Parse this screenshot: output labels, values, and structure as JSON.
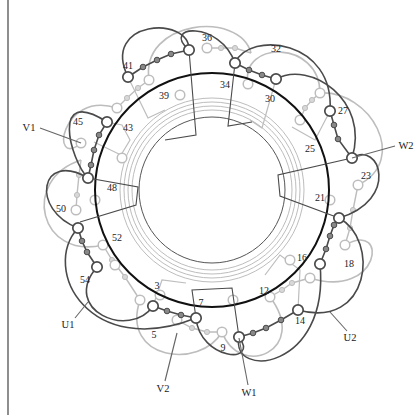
{
  "diagram": {
    "type": "stator winding diagram (54 slots, 3-phase)",
    "colors": {
      "dark": "#4a4a4a",
      "light": "#bdbdbd",
      "ring": "#111111",
      "text": "#222222",
      "background": "#ffffff"
    },
    "center": [
      212,
      190
    ],
    "main_ring_radius": 117,
    "inner_ring_radius": 73,
    "guide_ring_radii": [
      80,
      84,
      88,
      92
    ],
    "slot_labels": [
      {
        "text": "36",
        "x": 207,
        "y": 41
      },
      {
        "text": "32",
        "x": 276,
        "y": 52
      },
      {
        "text": "41",
        "x": 128,
        "y": 69
      },
      {
        "text": "34",
        "x": 225,
        "y": 88
      },
      {
        "text": "39",
        "x": 164,
        "y": 99
      },
      {
        "text": "30",
        "x": 270,
        "y": 102
      },
      {
        "text": "27",
        "x": 343,
        "y": 114
      },
      {
        "text": "45",
        "x": 78,
        "y": 125
      },
      {
        "text": "43",
        "x": 128,
        "y": 131
      },
      {
        "text": "25",
        "x": 310,
        "y": 152
      },
      {
        "text": "23",
        "x": 366,
        "y": 179
      },
      {
        "text": "48",
        "x": 112,
        "y": 191
      },
      {
        "text": "21",
        "x": 320,
        "y": 201
      },
      {
        "text": "50",
        "x": 61,
        "y": 212
      },
      {
        "text": "52",
        "x": 117,
        "y": 241
      },
      {
        "text": "16",
        "x": 302,
        "y": 261
      },
      {
        "text": "18",
        "x": 349,
        "y": 267
      },
      {
        "text": "54",
        "x": 85,
        "y": 283
      },
      {
        "text": "3",
        "x": 157,
        "y": 289
      },
      {
        "text": "12",
        "x": 264,
        "y": 294
      },
      {
        "text": "7",
        "x": 201,
        "y": 306
      },
      {
        "text": "14",
        "x": 300,
        "y": 324
      },
      {
        "text": "5",
        "x": 154,
        "y": 338
      },
      {
        "text": "9",
        "x": 223,
        "y": 351
      }
    ],
    "terminals": [
      {
        "text": "V1",
        "x": 29,
        "y": 131,
        "lead": [
          40,
          128,
          81,
          143
        ]
      },
      {
        "text": "W2",
        "x": 406,
        "y": 149,
        "lead": [
          395,
          146,
          352,
          158
        ]
      },
      {
        "text": "U1",
        "x": 68,
        "y": 328,
        "lead": [
          75,
          318,
          88,
          302
        ]
      },
      {
        "text": "U2",
        "x": 350,
        "y": 341,
        "lead": [
          347,
          331,
          330,
          312
        ]
      },
      {
        "text": "V2",
        "x": 163,
        "y": 392,
        "lead": [
          165,
          381,
          177,
          333
        ]
      },
      {
        "text": "W1",
        "x": 249,
        "y": 396,
        "lead": [
          248,
          385,
          239,
          338
        ]
      }
    ],
    "dark_nodes": [
      [
        189,
        50
      ],
      [
        128,
        77
      ],
      [
        107,
        122
      ],
      [
        88,
        178
      ],
      [
        78,
        228
      ],
      [
        97,
        267
      ],
      [
        153,
        306
      ],
      [
        196,
        318
      ],
      [
        239,
        337
      ],
      [
        298,
        310
      ],
      [
        320,
        264
      ],
      [
        339,
        218
      ],
      [
        352,
        158
      ],
      [
        330,
        111
      ],
      [
        276,
        79
      ],
      [
        235,
        63
      ]
    ],
    "dark_chains": [
      [
        [
          128,
          77
        ],
        [
          143,
          67
        ],
        [
          157,
          60
        ],
        [
          171,
          54
        ],
        [
          189,
          50
        ]
      ],
      [
        [
          88,
          178
        ],
        [
          91,
          165
        ],
        [
          94,
          150
        ],
        [
          99,
          135
        ],
        [
          107,
          122
        ]
      ],
      [
        [
          78,
          228
        ],
        [
          82,
          241
        ],
        [
          87,
          252
        ],
        [
          97,
          267
        ]
      ],
      [
        [
          153,
          306
        ],
        [
          167,
          311
        ],
        [
          181,
          315
        ],
        [
          196,
          318
        ]
      ],
      [
        [
          239,
          337
        ],
        [
          253,
          333
        ],
        [
          266,
          328
        ],
        [
          281,
          320
        ],
        [
          298,
          310
        ]
      ],
      [
        [
          320,
          264
        ],
        [
          326,
          249
        ],
        [
          330,
          236
        ],
        [
          334,
          225
        ],
        [
          339,
          218
        ]
      ],
      [
        [
          330,
          111
        ],
        [
          334,
          125
        ],
        [
          338,
          139
        ],
        [
          352,
          158
        ]
      ],
      [
        [
          235,
          63
        ],
        [
          249,
          70
        ],
        [
          262,
          75
        ],
        [
          276,
          79
        ]
      ]
    ],
    "dark_arcs": [
      "M 128 77 C 100 20, 190 15, 189 50",
      "M 107 122 C 50 85, 70 160, 88 178",
      "M 88 178 C 40 150, 30 210, 78 228",
      "M 97 267 C 60 310, 130 340, 153 306",
      "M 78 228 C 40 270, 90 360, 196 318",
      "M 196 318 C 200 360, 260 365, 239 337",
      "M 239 337 C 230 380, 330 370, 320 264",
      "M 298 310 C 370 330, 380 240, 339 218",
      "M 339 218 C 400 200, 380 140, 352 158",
      "M 352 158 C 370 100, 310 60, 276 79",
      "M 330 111 C 335 40, 250 30, 235 63",
      "M 235 63 C 220 20, 160 25, 189 50"
    ],
    "light_nodes": [
      [
        207,
        48
      ],
      [
        149,
        80
      ],
      [
        117,
        108
      ],
      [
        81,
        143
      ],
      [
        76,
        210
      ],
      [
        103,
        245
      ],
      [
        140,
        300
      ],
      [
        177,
        320
      ],
      [
        222,
        332
      ],
      [
        270,
        297
      ],
      [
        310,
        278
      ],
      [
        345,
        245
      ],
      [
        358,
        185
      ],
      [
        320,
        93
      ],
      [
        248,
        84
      ],
      [
        180,
        95
      ],
      [
        122,
        158
      ],
      [
        95,
        200
      ],
      [
        115,
        265
      ],
      [
        160,
        295
      ],
      [
        233,
        300
      ],
      [
        290,
        260
      ],
      [
        330,
        200
      ],
      [
        300,
        120
      ]
    ],
    "light_chains": [
      [
        [
          207,
          48
        ],
        [
          221,
          48
        ],
        [
          235,
          48
        ],
        [
          251,
          53
        ]
      ],
      [
        [
          117,
          108
        ],
        [
          127,
          98
        ],
        [
          138,
          88
        ],
        [
          149,
          80
        ]
      ],
      [
        [
          76,
          210
        ],
        [
          77,
          195
        ],
        [
          79,
          175
        ],
        [
          81,
          160
        ]
      ],
      [
        [
          103,
          245
        ],
        [
          112,
          260
        ],
        [
          125,
          277
        ],
        [
          140,
          300
        ]
      ],
      [
        [
          177,
          320
        ],
        [
          192,
          328
        ],
        [
          207,
          332
        ],
        [
          222,
          332
        ]
      ],
      [
        [
          270,
          297
        ],
        [
          282,
          290
        ],
        [
          292,
          283
        ],
        [
          310,
          278
        ]
      ],
      [
        [
          345,
          245
        ],
        [
          350,
          228
        ],
        [
          353,
          210
        ],
        [
          358,
          185
        ]
      ],
      [
        [
          300,
          120
        ],
        [
          305,
          108
        ],
        [
          312,
          100
        ],
        [
          320,
          93
        ]
      ]
    ],
    "light_arcs": [
      "M 149 80 C 140 20, 240 10, 251 53",
      "M 117 108 C 60 90, 50 170, 81 143",
      "M 81 160 C 20 180, 40 260, 103 245",
      "M 140 300 C 120 360, 200 370, 222 332",
      "M 222 332 C 240 380, 310 350, 270 297",
      "M 310 278 C 380 300, 390 220, 345 245",
      "M 358 185 C 410 160, 370 90, 320 93",
      "M 320 93 C 320 40, 240 40, 248 84"
    ],
    "coil_brackets_dark": [
      "M 189 50 L 196 135 L 165 140",
      "M 235 63 L 228 126 L 252 122",
      "M 88 178 L 138 187 L 136 205 L 80 222",
      "M 352 158 L 278 175 L 280 196 L 339 218",
      "M 196 318 L 192 290 L 232 288 L 239 337"
    ],
    "coil_brackets_light": [
      "M 107 122 L 122 125 L 130 140 L 121 155 L 94 142",
      "M 153 306 L 162 280 L 186 283",
      "M 298 310 L 300 270 L 280 255 L 265 275",
      "M 330 111 L 315 140 L 292 127",
      "M 276 79 L 262 128 L 250 120",
      "M 128 77 L 148 118 L 165 110"
    ]
  }
}
